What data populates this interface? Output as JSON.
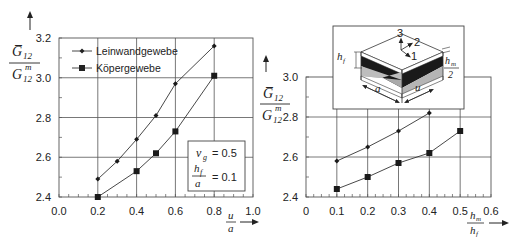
{
  "chart_data": [
    {
      "type": "line",
      "title": "",
      "xlabel": "u/a",
      "ylabel": "G̅12 / G12^m",
      "xlim": [
        0.0,
        1.0
      ],
      "ylim": [
        2.4,
        3.2
      ],
      "x_ticks": [
        "0.0",
        "0.2",
        "0.4",
        "0.6",
        "0.8",
        "1.0"
      ],
      "y_ticks": [
        "2.4",
        "2.6",
        "2.8",
        "3.0",
        "3.2"
      ],
      "grid": true,
      "legend_position": "upper-left",
      "series": [
        {
          "name": "Leinwandgewebe",
          "marker": "diamond",
          "x": [
            0.2,
            0.3,
            0.4,
            0.5,
            0.6,
            0.8
          ],
          "values": [
            2.49,
            2.58,
            2.69,
            2.81,
            2.97,
            3.16
          ]
        },
        {
          "name": "Köpergewebe",
          "marker": "square",
          "x": [
            0.2,
            0.4,
            0.5,
            0.6,
            0.8
          ],
          "values": [
            2.4,
            2.53,
            2.62,
            2.73,
            3.01
          ]
        }
      ],
      "annotation": {
        "line1_sym": "ν",
        "line1_sub": "g",
        "line1_val": "= 0.5",
        "line2_num": "hf",
        "line2_den": "a",
        "line2_val": "= 0.1"
      }
    },
    {
      "type": "line",
      "title": "",
      "xlabel": "hm/hf",
      "ylabel": "G̅12 / G12^m",
      "xlim": [
        0.0,
        0.6
      ],
      "ylim": [
        2.4,
        3.0
      ],
      "x_ticks": [
        "0",
        "0.1",
        "0.2",
        "0.3",
        "0.4",
        "0.5",
        "0.6"
      ],
      "y_ticks": [
        "2.4",
        "2.6",
        "2.8",
        "3.0"
      ],
      "grid": true,
      "series": [
        {
          "name": "Leinwandgewebe",
          "marker": "diamond",
          "x": [
            0.1,
            0.2,
            0.3,
            0.4
          ],
          "values": [
            2.58,
            2.65,
            2.73,
            2.82
          ]
        },
        {
          "name": "Köpergewebe",
          "marker": "square",
          "x": [
            0.1,
            0.2,
            0.3,
            0.4,
            0.5
          ],
          "values": [
            2.44,
            2.5,
            2.57,
            2.62,
            2.73
          ]
        }
      ],
      "inset_labels": {
        "axis3": "3",
        "axis2": "2",
        "axis1": "1",
        "hf": "hf",
        "hm_num": "hm",
        "hm_den": "2",
        "a": "a",
        "u": "u"
      }
    }
  ],
  "left": {
    "ylabel_num": "G̅",
    "ylabel_num_sub": "12",
    "ylabel_den": "G",
    "ylabel_den_sub": "12",
    "ylabel_den_sup": "m",
    "xlabel_num": "u",
    "xlabel_den": "a",
    "legend": [
      "Leinwandgewebe",
      "Köpergewebe"
    ],
    "box_l1_sym": "ν",
    "box_l1_sub": "g",
    "box_l1_val": "= 0.5",
    "box_l2_num": "h",
    "box_l2_num_sub": "f",
    "box_l2_den": "a",
    "box_l2_val": "= 0.1"
  },
  "right": {
    "ylabel_num": "G̅",
    "ylabel_num_sub": "12",
    "ylabel_den": "G",
    "ylabel_den_sub": "12",
    "ylabel_den_sup": "m",
    "xlabel_num": "h",
    "xlabel_num_sub": "m",
    "xlabel_den": "h",
    "xlabel_den_sub": "f",
    "inset": {
      "n3": "3",
      "n2": "2",
      "n1": "1",
      "hf": "h",
      "hf_sub": "f",
      "hm": "h",
      "hm_sub": "m",
      "hm_den": "2",
      "a": "a",
      "u": "u"
    }
  }
}
